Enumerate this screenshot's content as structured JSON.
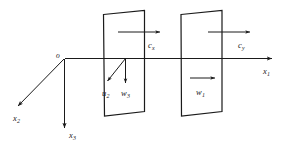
{
  "figure": {
    "caption": "",
    "background_color": "#ffffff",
    "line_color": "#1a1a1a",
    "width": 288,
    "height": 149
  },
  "origin": {
    "name": "origin-label",
    "base": "o",
    "sub": ""
  },
  "axes": [
    {
      "id": "x1",
      "base": "x",
      "sub": "1",
      "direction": "right",
      "description": "axial axis pointing right"
    },
    {
      "id": "x2",
      "base": "x",
      "sub": "2",
      "direction": "down-left",
      "description": "axis pointing down and to the left"
    },
    {
      "id": "x3",
      "base": "x",
      "sub": "3",
      "direction": "down",
      "description": "axis pointing straight down"
    }
  ],
  "plates": [
    {
      "id": "plate-1",
      "label": "first blade row"
    },
    {
      "id": "plate-2",
      "label": "second blade row"
    }
  ],
  "vectors": [
    {
      "id": "cx",
      "base": "c",
      "sub": "x",
      "direction": "right",
      "description": "axial velocity component at first plate"
    },
    {
      "id": "cy",
      "base": "c",
      "sub": "y",
      "direction": "right",
      "description": "velocity component at second plate"
    },
    {
      "id": "u2",
      "base": "u",
      "sub": "2",
      "direction": "down-left",
      "description": "blade speed vector pointing down-left"
    },
    {
      "id": "w3",
      "base": "w",
      "sub": "3",
      "direction": "down",
      "description": "relative velocity component pointing down"
    },
    {
      "id": "w1",
      "base": "w",
      "sub": "1",
      "direction": "right",
      "description": "relative velocity at second plate pointing right"
    }
  ]
}
